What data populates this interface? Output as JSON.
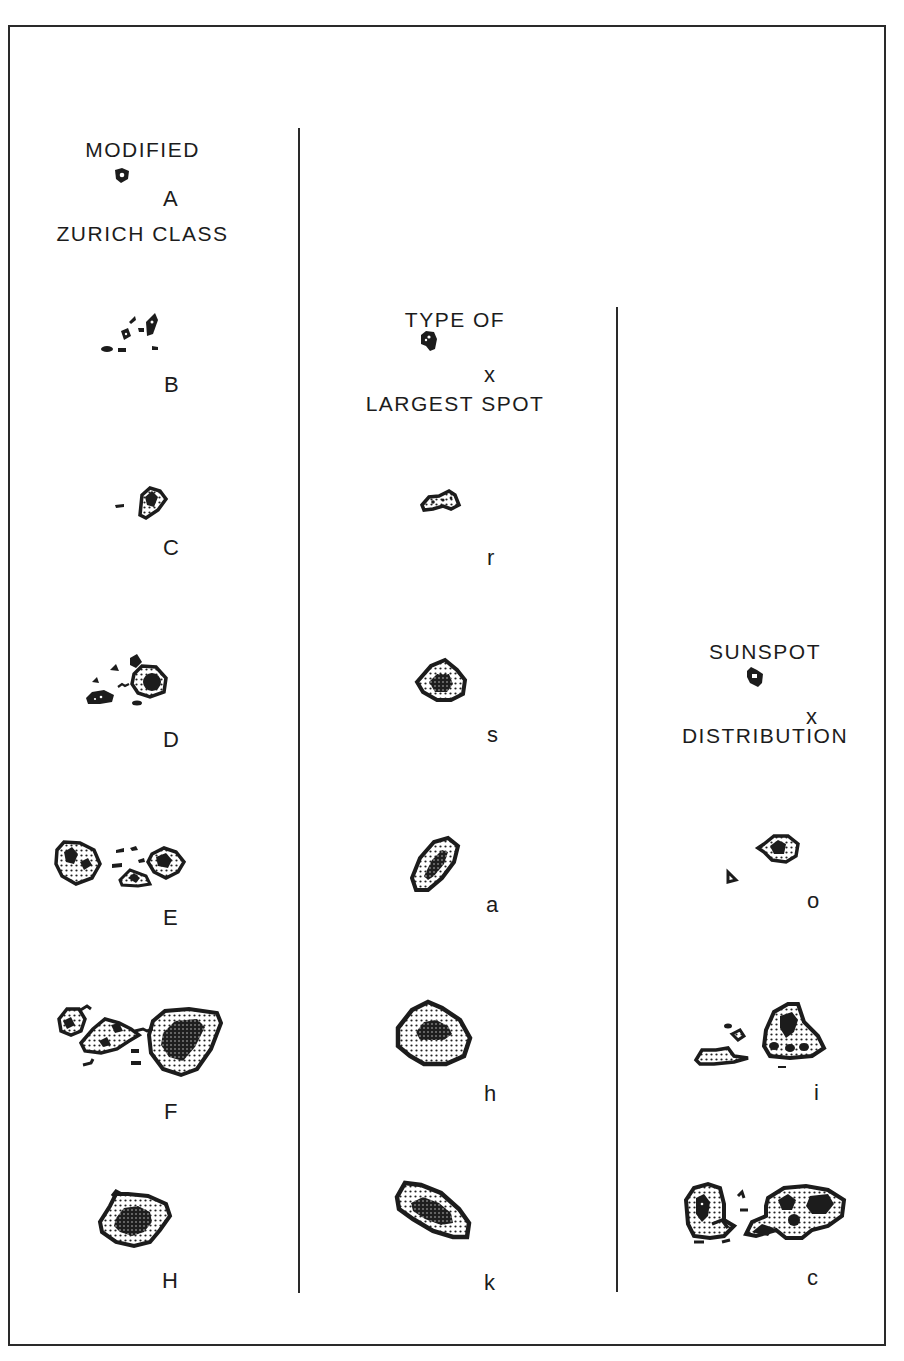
{
  "figure": {
    "columns": [
      {
        "heading_line1": "MODIFIED",
        "heading_line2": "ZURICH CLASS",
        "classes": [
          {
            "label": "A",
            "icon": "unipolar-small-spot-icon"
          },
          {
            "label": "B",
            "icon": "bipolar-spots-no-penumbra-icon"
          },
          {
            "label": "C",
            "icon": "bipolar-one-penumbra-icon"
          },
          {
            "label": "D",
            "icon": "bipolar-penumbra-both-ends-icon"
          },
          {
            "label": "E",
            "icon": "bipolar-large-group-icon"
          },
          {
            "label": "F",
            "icon": "bipolar-very-large-group-icon"
          },
          {
            "label": "H",
            "icon": "unipolar-with-penumbra-icon"
          }
        ]
      },
      {
        "heading_line1": "TYPE OF",
        "heading_line2": "LARGEST SPOT",
        "classes": [
          {
            "label": "x",
            "icon": "no-penumbra-spot-icon"
          },
          {
            "label": "r",
            "icon": "rudimentary-penumbra-icon"
          },
          {
            "label": "s",
            "icon": "small-symmetric-penumbra-icon"
          },
          {
            "label": "a",
            "icon": "small-asymmetric-penumbra-icon"
          },
          {
            "label": "h",
            "icon": "large-symmetric-penumbra-icon"
          },
          {
            "label": "k",
            "icon": "large-asymmetric-penumbra-icon"
          }
        ]
      },
      {
        "heading_line1": "SUNSPOT",
        "heading_line2": "DISTRIBUTION",
        "classes": [
          {
            "label": "x",
            "icon": "single-spot-icon"
          },
          {
            "label": "o",
            "icon": "open-distribution-icon"
          },
          {
            "label": "i",
            "icon": "intermediate-distribution-icon"
          },
          {
            "label": "c",
            "icon": "compact-distribution-icon"
          }
        ]
      }
    ]
  }
}
